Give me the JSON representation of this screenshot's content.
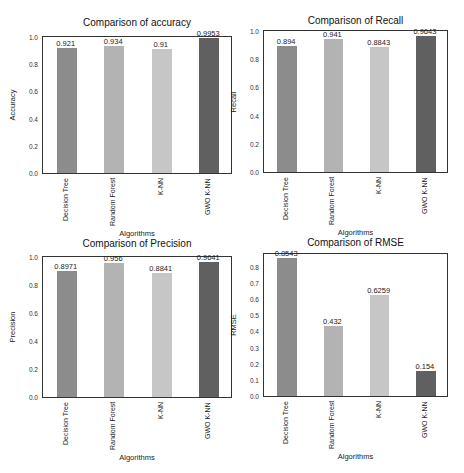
{
  "chart_data": [
    {
      "type": "bar",
      "title": "Comparison of accuracy",
      "xlabel": "Algorithms",
      "ylabel": "Accuracy",
      "categories": [
        "Decision Tree",
        "Random Forest",
        "K-NN",
        "GWO K-NN"
      ],
      "values": [
        0.921,
        0.934,
        0.91,
        0.9953
      ],
      "value_labels": [
        "0.921",
        "0.934",
        "0.91",
        "0.9953"
      ],
      "yticks": [
        "0.0",
        "0.2",
        "0.4",
        "0.6",
        "0.8",
        "1.0"
      ],
      "ylim": [
        0,
        1.0
      ],
      "grid": false
    },
    {
      "type": "bar",
      "title": "Comparison of Recall",
      "xlabel": "Algorithms",
      "ylabel": "Recall",
      "categories": [
        "Decision Tree",
        "Random Forest",
        "K-NN",
        "GWO K-NN"
      ],
      "values": [
        0.894,
        0.941,
        0.8843,
        0.9643
      ],
      "value_labels": [
        "0.894",
        "0.941",
        "0.8843",
        "0.9643"
      ],
      "yticks": [
        "0.0",
        "0.2",
        "0.4",
        "0.6",
        "0.8",
        "1.0"
      ],
      "ylim": [
        0,
        1.0
      ],
      "grid": false
    },
    {
      "type": "bar",
      "title": "Comparison of Precision",
      "xlabel": "Algorithms",
      "ylabel": "Precision",
      "categories": [
        "Decision Tree",
        "Random Forest",
        "K-NN",
        "GWO K-NN"
      ],
      "values": [
        0.8971,
        0.956,
        0.8841,
        0.9641
      ],
      "value_labels": [
        "0.8971",
        "0.956",
        "0.8841",
        "0.9641"
      ],
      "yticks": [
        "0.0",
        "0.2",
        "0.4",
        "0.6",
        "0.8",
        "1.0"
      ],
      "ylim": [
        0,
        1.0
      ],
      "grid": false
    },
    {
      "type": "bar",
      "title": "Comparison of RMSE",
      "xlabel": "Algorithms",
      "ylabel": "RMSE",
      "categories": [
        "Decision Tree",
        "Random Forest",
        "K-NN",
        "GWO K-NN"
      ],
      "values": [
        0.8543,
        0.432,
        0.6259,
        0.154
      ],
      "value_labels": [
        "0.8543",
        "0.432",
        "0.6259",
        "0.154"
      ],
      "yticks": [
        "0.0",
        "0.1",
        "0.2",
        "0.3",
        "0.4",
        "0.5",
        "0.6",
        "0.7",
        "0.8"
      ],
      "ylim": [
        0,
        0.88
      ],
      "grid": false
    }
  ],
  "colors": {
    "bars": [
      "#8c8c8c",
      "#b3b3b3",
      "#c6c6c6",
      "#606060"
    ],
    "frame": "#333333",
    "background": "#ffffff"
  }
}
